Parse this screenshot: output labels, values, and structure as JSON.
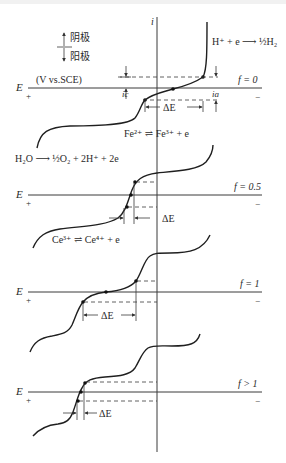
{
  "figure": {
    "legend": {
      "cathode_label": "阴极",
      "anode_label": "阳极"
    },
    "current_axis_label": "i",
    "panels": [
      {
        "f_label": "f = 0",
        "e_label": "E",
        "plus": "+",
        "minus": "−",
        "units": "(V vs.SCE)",
        "ic_label": "ic",
        "ia_label": "ia",
        "delta_e_label": "ΔE",
        "reaction_top_right": "H⁺ + e ⟶ ½H₂",
        "reaction_below": "Fe²⁺ ⇌ Fe³⁺ + e"
      },
      {
        "f_label": "f = 0.5",
        "e_label": "E",
        "plus": "+",
        "minus": "−",
        "delta_e_label": "ΔE",
        "reaction_left": "H₂O ⟶ ½O₂ + 2H⁺ + 2e",
        "reaction_below": "Ce³⁺ ⇌ Ce⁴⁺ + e"
      },
      {
        "f_label": "f = 1",
        "e_label": "E",
        "plus": "+",
        "minus": "−",
        "delta_e_label": "ΔE"
      },
      {
        "f_label": "f > 1",
        "e_label": "E",
        "plus": "+",
        "minus": "−",
        "delta_e_label": "ΔE"
      }
    ]
  }
}
